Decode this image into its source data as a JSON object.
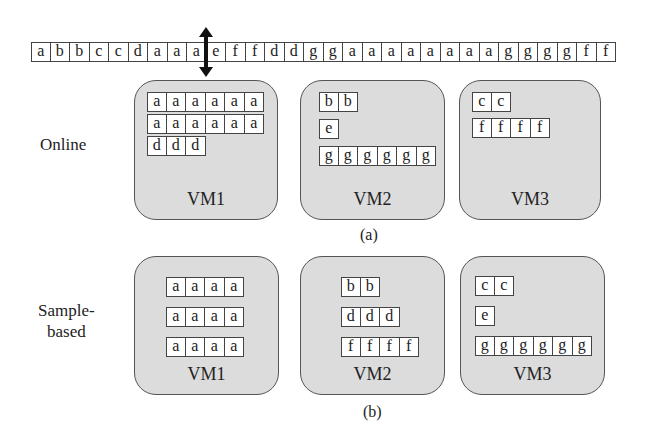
{
  "sequence": [
    "a",
    "b",
    "b",
    "c",
    "c",
    "d",
    "a",
    "a",
    "a",
    "e",
    "f",
    "f",
    "d",
    "d",
    "g",
    "g",
    "a",
    "a",
    "a",
    "a",
    "a",
    "a",
    "a",
    "a",
    "g",
    "g",
    "g",
    "g",
    "f",
    "f"
  ],
  "arrow": {
    "icon": "double-vertical-arrow-icon",
    "position_after_index": 8
  },
  "panel_a": {
    "side_label": "Online",
    "caption": "(a)",
    "vms": [
      {
        "label": "VM1",
        "rows": [
          [
            "a",
            "a",
            "a",
            "a",
            "a",
            "a"
          ],
          [
            "a",
            "a",
            "a",
            "a",
            "a",
            "a"
          ],
          [
            "d",
            "d",
            "d"
          ]
        ]
      },
      {
        "label": "VM2",
        "rows": [
          [
            "b",
            "b"
          ],
          [
            "e"
          ],
          [
            "g",
            "g",
            "g",
            "g",
            "g",
            "g"
          ]
        ]
      },
      {
        "label": "VM3",
        "rows": [
          [
            "c",
            "c"
          ],
          [
            "f",
            "f",
            "f",
            "f"
          ]
        ]
      }
    ]
  },
  "panel_b": {
    "side_label_line1": "Sample-",
    "side_label_line2": "based",
    "caption": "(b)",
    "vms": [
      {
        "label": "VM1",
        "rows": [
          [
            "a",
            "a",
            "a",
            "a"
          ],
          [
            "a",
            "a",
            "a",
            "a"
          ],
          [
            "a",
            "a",
            "a",
            "a"
          ]
        ]
      },
      {
        "label": "VM2",
        "rows": [
          [
            "b",
            "b"
          ],
          [
            "d",
            "d",
            "d"
          ],
          [
            "f",
            "f",
            "f",
            "f"
          ]
        ]
      },
      {
        "label": "VM3",
        "rows": [
          [
            "c",
            "c"
          ],
          [
            "e"
          ],
          [
            "g",
            "g",
            "g",
            "g",
            "g",
            "g"
          ]
        ]
      }
    ]
  },
  "colors": {
    "vm_fill": "#dcdcdc",
    "border": "#444444",
    "arrow": "#111111"
  }
}
